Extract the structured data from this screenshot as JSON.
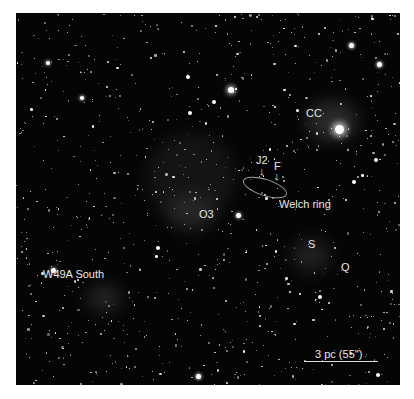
{
  "image": {
    "description": "Deep-field near-infrared starfield of the W49A region",
    "background_color": "#050505",
    "frame_color": "#ffffff"
  },
  "labels": {
    "cc": "CC",
    "j2": "J2",
    "f": "F",
    "j2_arrow": "↓",
    "f_arrow": "↓",
    "welch_ring": "Welch ring",
    "o3": "O3",
    "s": "S",
    "q": "Q",
    "w49a_south": "W49A South"
  },
  "scale_bar": {
    "label": "3 pc (55\")"
  }
}
